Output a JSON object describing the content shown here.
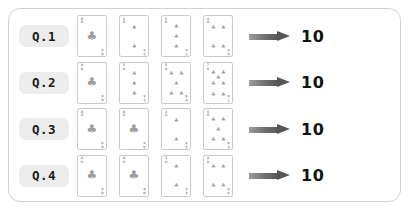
{
  "panel": {
    "border_color": "#d2d2d2",
    "background_color": "#ffffff"
  },
  "style": {
    "badge_color": "#ececec",
    "pip_color": "#9e9e9e",
    "arrow_color": "#555555",
    "answer_color": "#111111"
  },
  "rows": [
    {
      "label": "Q.1",
      "cards": [
        {
          "rank": "A",
          "suit": "♣",
          "pips": 1
        },
        {
          "rank": "2",
          "suit": "♣",
          "pips": 2
        },
        {
          "rank": "3",
          "suit": "♣",
          "pips": 3
        },
        {
          "rank": "4",
          "suit": "♣",
          "pips": 4
        }
      ],
      "arrow": "right-arrow",
      "answer": "10"
    },
    {
      "label": "Q.2",
      "cards": [
        {
          "rank": "A",
          "suit": "♣",
          "pips": 1
        },
        {
          "rank": "3",
          "suit": "♣",
          "pips": 3
        },
        {
          "rank": "5",
          "suit": "♣",
          "pips": 5
        },
        {
          "rank": "7",
          "suit": "♣",
          "pips": 7
        }
      ],
      "arrow": "right-arrow",
      "answer": "10"
    },
    {
      "label": "Q.3",
      "cards": [
        {
          "rank": "A",
          "suit": "♣",
          "pips": 1
        },
        {
          "rank": "A",
          "suit": "♣",
          "pips": 1
        },
        {
          "rank": "2",
          "suit": "♣",
          "pips": 2
        },
        {
          "rank": "5",
          "suit": "♣",
          "pips": 5
        }
      ],
      "arrow": "right-arrow",
      "answer": "10"
    },
    {
      "label": "Q.4",
      "cards": [
        {
          "rank": "A",
          "suit": "♣",
          "pips": 1
        },
        {
          "rank": "A",
          "suit": "♣",
          "pips": 1
        },
        {
          "rank": "2",
          "suit": "♣",
          "pips": 2
        },
        {
          "rank": "4",
          "suit": "♣",
          "pips": 4
        }
      ],
      "arrow": "right-arrow",
      "answer": "10"
    }
  ]
}
